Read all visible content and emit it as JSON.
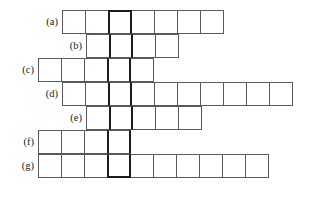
{
  "puzzle": {
    "type": "crossword-answer-grid",
    "grid_geometry": {
      "cell_size_px": 24,
      "origin_x_px": 38,
      "origin_y_px": 10,
      "columns": 11,
      "rows": 7
    },
    "highlight_column_index": 3,
    "highlight_color": "#1c1c1c",
    "cell_border_color": "#59595c",
    "background_color": "#ffffff",
    "rows": [
      {
        "label": "(a)",
        "start_col": 1,
        "cell_count": 7,
        "letters": [
          "",
          "",
          "",
          "",
          "",
          "",
          ""
        ]
      },
      {
        "label": "(b)",
        "start_col": 2,
        "cell_count": 4,
        "letters": [
          "",
          "",
          "",
          ""
        ]
      },
      {
        "label": "(c)",
        "start_col": 0,
        "cell_count": 5,
        "letters": [
          "",
          "",
          "",
          "",
          ""
        ]
      },
      {
        "label": "(d)",
        "start_col": 1,
        "cell_count": 10,
        "letters": [
          "",
          "",
          "",
          "",
          "",
          "",
          "",
          "",
          "",
          ""
        ]
      },
      {
        "label": "(e)",
        "start_col": 2,
        "cell_count": 5,
        "letters": [
          "",
          "",
          "",
          "",
          ""
        ]
      },
      {
        "label": "(f)",
        "start_col": 0,
        "cell_count": 4,
        "letters": [
          "",
          "",
          "",
          ""
        ]
      },
      {
        "label": "(g)",
        "start_col": 0,
        "cell_count": 10,
        "letters": [
          "",
          "",
          "",
          "",
          "",
          "",
          "",
          "",
          "",
          ""
        ]
      }
    ]
  }
}
